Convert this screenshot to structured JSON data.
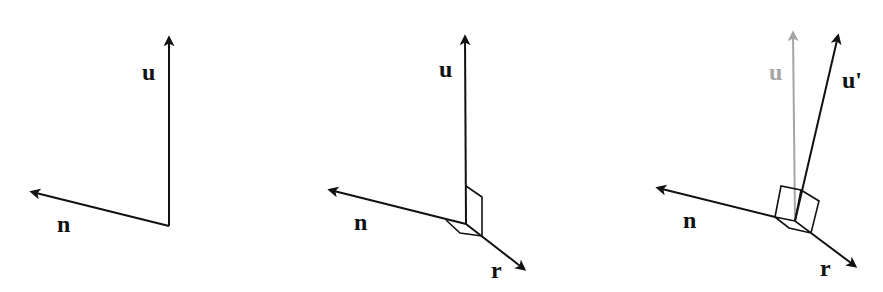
{
  "colors": {
    "ink": "#111111",
    "faded": "#a6a6a6",
    "background": "#ffffff"
  },
  "panels": [
    {
      "id": "panel-1",
      "labels": {
        "u": "u",
        "n": "n"
      }
    },
    {
      "id": "panel-2",
      "labels": {
        "u": "u",
        "n": "n",
        "r": "r"
      }
    },
    {
      "id": "panel-3",
      "labels": {
        "u_old": "u",
        "u_new": "u'",
        "n": "n",
        "r": "r"
      }
    }
  ]
}
